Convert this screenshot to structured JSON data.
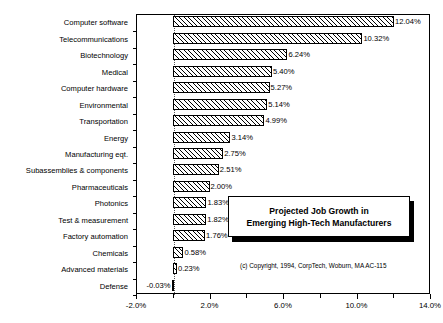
{
  "chart_data": {
    "type": "bar",
    "orientation": "horizontal",
    "title": "Projected Job Growth in Emerging High-Tech Manufacturers",
    "title_lines": [
      "Projected Job Growth in",
      "Emerging High-Tech Manufacturers"
    ],
    "xlabel": "",
    "ylabel": "",
    "xlim": [
      -2.0,
      14.0
    ],
    "xticks": [
      -2.0,
      2.0,
      6.0,
      10.0,
      14.0
    ],
    "xtick_labels": [
      "-2.0%",
      "2.0%",
      "6.0%",
      "10.0%",
      "14.0%"
    ],
    "minor_xticks": [
      0.0,
      4.0,
      8.0,
      12.0
    ],
    "grid": false,
    "legend": null,
    "zero_line": 0.0,
    "categories": [
      "Computer software",
      "Telecommunications",
      "Biotechnology",
      "Medical",
      "Computer hardware",
      "Environmental",
      "Transportation",
      "Energy",
      "Manufacturing eqt.",
      "Subassemblies & components",
      "Pharmaceuticals",
      "Photonics",
      "Test & measurement",
      "Factory automation",
      "Chemicals",
      "Advanced materials",
      "Defense"
    ],
    "values": [
      12.04,
      10.32,
      6.24,
      5.4,
      5.27,
      5.14,
      4.99,
      3.14,
      2.75,
      2.51,
      2.0,
      1.83,
      1.82,
      1.76,
      0.58,
      0.23,
      -0.03
    ],
    "value_labels": [
      "12.04%",
      "10.32%",
      "6.24%",
      "5.40%",
      "5.27%",
      "5.14%",
      "4.99%",
      "3.14%",
      "2.75%",
      "2.51%",
      "2.00%",
      "1.83%",
      "1.82%",
      "1.76%",
      "0.58%",
      "0.23%",
      "-0.03%"
    ],
    "bar_fill": "diagonal-hatch",
    "bar_edge_color": "#000000"
  },
  "annotations": {
    "copyright": "(c) Copyright, 1994, CorpTech, Woburn, MA  AC-115"
  }
}
